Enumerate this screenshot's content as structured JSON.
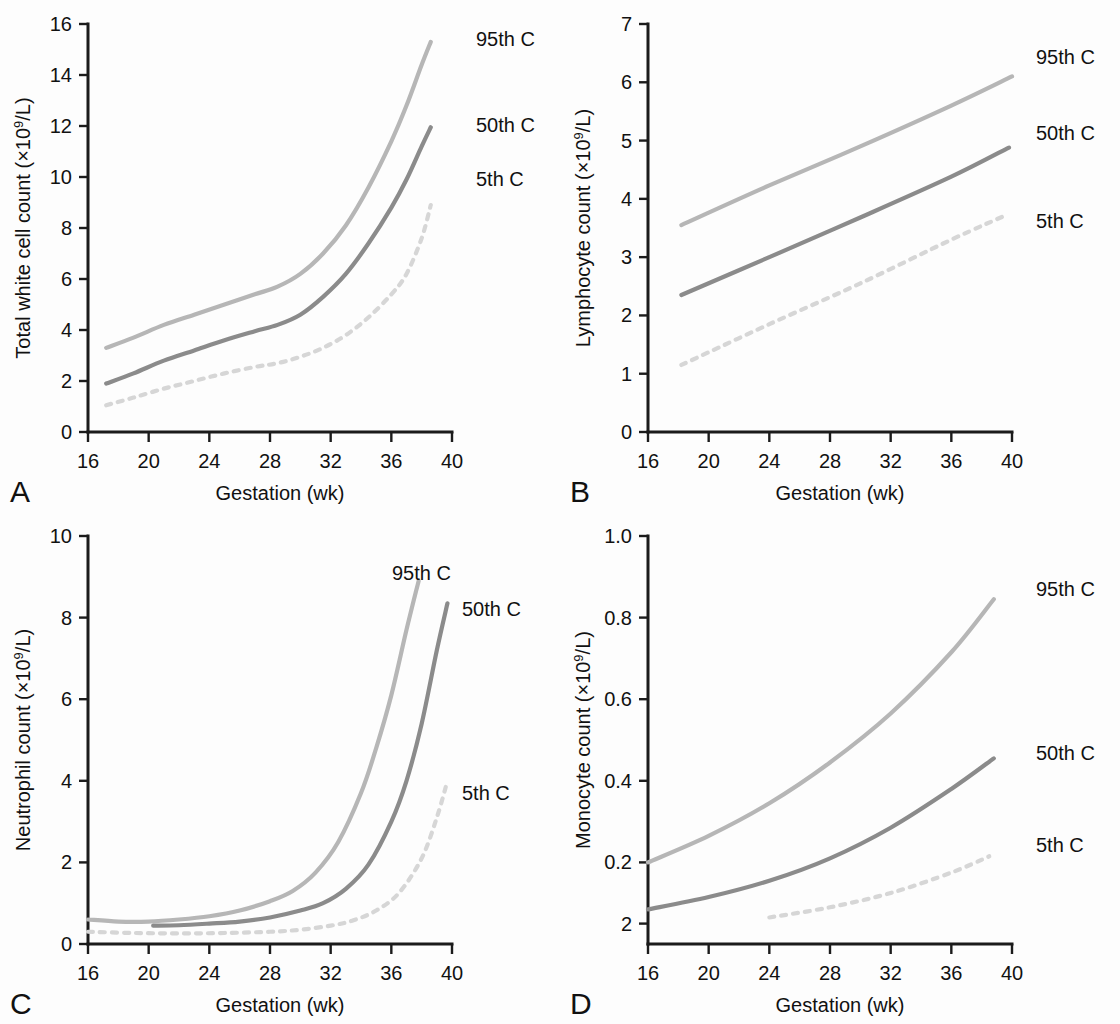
{
  "figure": {
    "background_color": "#fdfdfd",
    "panel_letters": [
      "A",
      "B",
      "C",
      "D"
    ],
    "shared_xlabel": "Gestation (wk)",
    "series_colors": {
      "95th": "#b6b6b6",
      "50th": "#8b8b8b",
      "5th": "#d6d6d6"
    }
  },
  "chart_data": [
    {
      "type": "line",
      "panel": "A",
      "title": "",
      "xlabel": "Gestation (wk)",
      "ylabel": "Total white cell count (×10⁹/L)",
      "ylabel_main": "Total white cell count (×10",
      "ylabel_sup": "9",
      "ylabel_tail": "/L)",
      "xlim": [
        16,
        40
      ],
      "ylim": [
        0,
        16
      ],
      "xticks": [
        16,
        20,
        24,
        28,
        32,
        36,
        40
      ],
      "yticks": [
        0,
        2,
        4,
        6,
        8,
        10,
        12,
        14,
        16
      ],
      "xticklabels": [
        "16",
        "20",
        "24",
        "28",
        "32",
        "36",
        "40"
      ],
      "yticklabels": [
        "0",
        "2",
        "4",
        "6",
        "8",
        "10",
        "12",
        "14",
        "16"
      ],
      "grid": false,
      "legend_position": "right-inline",
      "series": [
        {
          "name": "95th C",
          "style": "solid",
          "color": "#b6b6b6",
          "x": [
            17.2,
            19,
            21,
            23,
            25,
            27,
            28.5,
            30,
            31.5,
            33,
            34.5,
            36,
            37,
            38,
            38.6
          ],
          "values": [
            3.3,
            3.7,
            4.2,
            4.6,
            5.0,
            5.4,
            5.7,
            6.2,
            7.0,
            8.1,
            9.6,
            11.4,
            12.8,
            14.4,
            15.3
          ]
        },
        {
          "name": "50th C",
          "style": "solid",
          "color": "#8b8b8b",
          "x": [
            17.2,
            19,
            21,
            23,
            25,
            27,
            28.5,
            30,
            31.5,
            33,
            34.5,
            36,
            37,
            38,
            38.6
          ],
          "values": [
            1.9,
            2.3,
            2.8,
            3.2,
            3.6,
            3.95,
            4.2,
            4.6,
            5.3,
            6.2,
            7.4,
            8.8,
            9.9,
            11.2,
            11.95
          ]
        },
        {
          "name": "5th C",
          "style": "dotted",
          "color": "#d6d6d6",
          "x": [
            17.2,
            19,
            21,
            23,
            25,
            27,
            28.5,
            30,
            31.5,
            33,
            34.5,
            36,
            37,
            38,
            38.6
          ],
          "values": [
            1.05,
            1.35,
            1.7,
            2.0,
            2.3,
            2.55,
            2.7,
            2.95,
            3.3,
            3.8,
            4.5,
            5.4,
            6.2,
            7.6,
            8.9
          ]
        }
      ]
    },
    {
      "type": "line",
      "panel": "B",
      "title": "",
      "xlabel": "Gestation (wk)",
      "ylabel": "Lymphocyte count (×10⁹/L)",
      "ylabel_main": "Lymphocyte count (×10",
      "ylabel_sup": "9",
      "ylabel_tail": "/L)",
      "xlim": [
        16,
        40
      ],
      "ylim": [
        0,
        7
      ],
      "xticks": [
        16,
        20,
        24,
        28,
        32,
        36,
        40
      ],
      "yticks": [
        0,
        1,
        2,
        3,
        4,
        5,
        6,
        7
      ],
      "xticklabels": [
        "16",
        "20",
        "24",
        "28",
        "32",
        "36",
        "40"
      ],
      "yticklabels": [
        "0",
        "1",
        "2",
        "3",
        "4",
        "5",
        "6",
        "7"
      ],
      "grid": false,
      "legend_position": "right-inline",
      "series": [
        {
          "name": "95th C",
          "style": "solid",
          "color": "#b6b6b6",
          "x": [
            18.2,
            24,
            30,
            36,
            40
          ],
          "values": [
            3.55,
            4.23,
            4.9,
            5.6,
            6.1
          ]
        },
        {
          "name": "50th C",
          "style": "solid",
          "color": "#8b8b8b",
          "x": [
            18.2,
            24,
            30,
            36,
            39.8
          ],
          "values": [
            2.35,
            3.0,
            3.68,
            4.38,
            4.88
          ]
        },
        {
          "name": "5th C",
          "style": "dotted",
          "color": "#d6d6d6",
          "x": [
            18.2,
            24,
            30,
            36,
            39.6
          ],
          "values": [
            1.15,
            1.85,
            2.55,
            3.3,
            3.72
          ]
        }
      ]
    },
    {
      "type": "line",
      "panel": "C",
      "title": "",
      "xlabel": "Gestation (wk)",
      "ylabel": "Neutrophil count (×10⁹/L)",
      "ylabel_main": "Neutrophil count (×10",
      "ylabel_sup": "9",
      "ylabel_tail": "/L)",
      "xlim": [
        16,
        40
      ],
      "ylim": [
        0,
        10
      ],
      "xticks": [
        16,
        20,
        24,
        28,
        32,
        36,
        40
      ],
      "yticks": [
        0,
        2,
        4,
        6,
        8,
        10
      ],
      "xticklabels": [
        "16",
        "20",
        "24",
        "28",
        "32",
        "36",
        "40"
      ],
      "yticklabels": [
        "0",
        "2",
        "4",
        "6",
        "8",
        "10"
      ],
      "grid": false,
      "legend_position": "right-inline",
      "series": [
        {
          "name": "95th C",
          "style": "solid",
          "color": "#b6b6b6",
          "x": [
            16,
            18,
            20,
            22,
            24,
            26,
            28,
            29.5,
            31,
            32.5,
            34,
            35,
            36,
            37,
            37.8
          ],
          "values": [
            0.6,
            0.55,
            0.55,
            0.6,
            0.68,
            0.82,
            1.05,
            1.3,
            1.75,
            2.5,
            3.7,
            4.8,
            6.1,
            7.7,
            8.9
          ]
        },
        {
          "name": "50th C",
          "style": "solid",
          "color": "#8b8b8b",
          "x": [
            20.3,
            22,
            24,
            26,
            28,
            30,
            31.5,
            33,
            34.5,
            36,
            37,
            38,
            39,
            39.7
          ],
          "values": [
            0.45,
            0.46,
            0.5,
            0.55,
            0.65,
            0.82,
            1.0,
            1.35,
            1.95,
            3.0,
            4.0,
            5.4,
            7.2,
            8.35
          ]
        },
        {
          "name": "5th C",
          "style": "dotted",
          "color": "#d6d6d6",
          "x": [
            16,
            19,
            22,
            25,
            28,
            30,
            32,
            33.5,
            35,
            36.5,
            38,
            39,
            39.7
          ],
          "values": [
            0.3,
            0.27,
            0.26,
            0.27,
            0.3,
            0.35,
            0.45,
            0.58,
            0.82,
            1.25,
            2.1,
            3.1,
            4.0
          ]
        }
      ]
    },
    {
      "type": "line",
      "panel": "D",
      "title": "",
      "xlabel": "Gestation (wk)",
      "ylabel": "Monocyte count (×10⁹/L)",
      "ylabel_main": "Monocyte count (×10",
      "ylabel_sup": "9",
      "ylabel_tail": "/L)",
      "xlim": [
        16,
        40
      ],
      "ylim": [
        0.0,
        1.0
      ],
      "xticks": [
        16,
        20,
        24,
        28,
        32,
        36,
        40
      ],
      "yticks": [
        1.0,
        0.8,
        0.6,
        0.4,
        0.2,
        0.05
      ],
      "xticklabels": [
        "16",
        "20",
        "24",
        "28",
        "32",
        "36",
        "40"
      ],
      "yticklabels": [
        "1.0",
        "0.8",
        "0.6",
        "0.4",
        "0.2",
        "2"
      ],
      "grid": false,
      "legend_position": "right-inline",
      "series": [
        {
          "name": "95th C",
          "style": "solid",
          "color": "#b6b6b6",
          "x": [
            16,
            20,
            24,
            28,
            32,
            36,
            38.8
          ],
          "values": [
            0.2,
            0.265,
            0.345,
            0.445,
            0.565,
            0.715,
            0.845
          ]
        },
        {
          "name": "50th C",
          "style": "solid",
          "color": "#8b8b8b",
          "x": [
            16,
            20,
            24,
            28,
            32,
            36,
            38.8
          ],
          "values": [
            0.085,
            0.115,
            0.155,
            0.21,
            0.285,
            0.38,
            0.455
          ]
        },
        {
          "name": "5th C",
          "style": "dotted",
          "color": "#d6d6d6",
          "x": [
            24,
            28,
            32,
            36,
            38.5
          ],
          "values": [
            0.065,
            0.09,
            0.125,
            0.175,
            0.215
          ]
        }
      ]
    }
  ]
}
